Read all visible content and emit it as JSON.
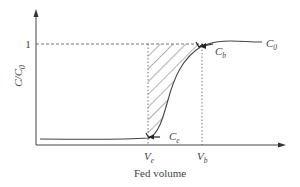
{
  "diagram": {
    "type": "breakthrough-curve",
    "y_axis_label": "C/C",
    "y_axis_label_sub": "0",
    "x_axis_label": "Fed volume",
    "y_tick_label": "1",
    "x_markers": [
      {
        "main": "V",
        "sub": "e"
      },
      {
        "main": "V",
        "sub": "b"
      }
    ],
    "curve_labels": {
      "c0": {
        "main": "C",
        "sub": "0"
      },
      "cb": {
        "main": "C",
        "sub": "b"
      },
      "ce": {
        "main": "C",
        "sub": "e"
      }
    },
    "colors": {
      "axis": "#444444",
      "curve": "#444444",
      "dashed": "#555555",
      "hatch": "#555555",
      "text": "#444444"
    }
  }
}
